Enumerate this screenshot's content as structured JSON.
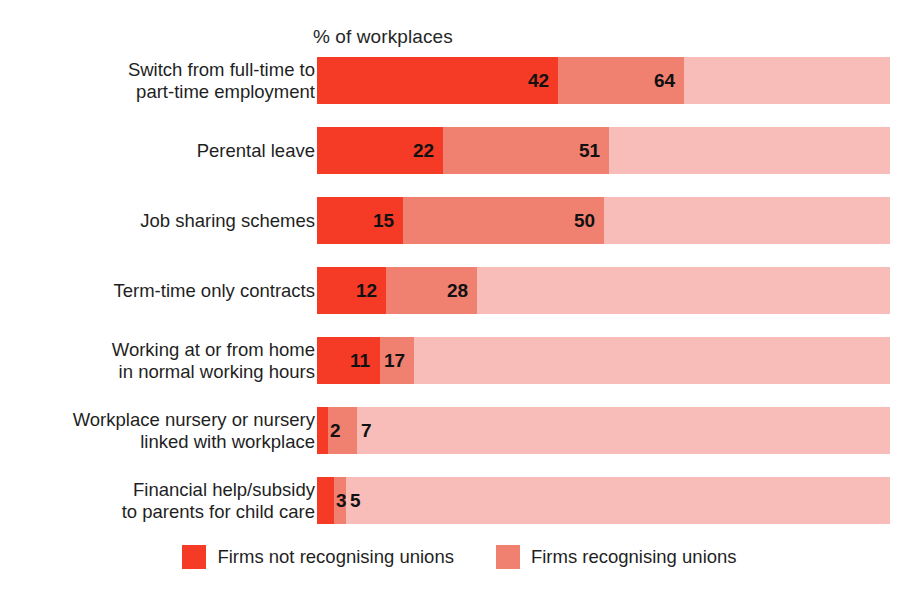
{
  "chart_data": {
    "type": "bar",
    "orientation": "horizontal",
    "stacked": false,
    "overlapping_bars": true,
    "title": "",
    "xlabel": "% of workplaces",
    "ylabel": "",
    "xlim": [
      0,
      100
    ],
    "grid": false,
    "legend_position": "bottom-center",
    "categories": [
      "Switch from full-time to\npart-time employment",
      "Perental leave",
      "Job sharing schemes",
      "Term-time only contracts",
      "Working at or from home\nin normal working hours",
      "Workplace nursery or nursery\nlinked with workplace",
      "Financial help/subsidy\nto parents for child care"
    ],
    "series": [
      {
        "name": "Firms not recognising unions",
        "color": "#f53b26",
        "values": [
          42,
          22,
          15,
          12,
          11,
          2,
          3
        ]
      },
      {
        "name": "Firms recognising unions",
        "color": "#f08070",
        "values": [
          64,
          51,
          50,
          28,
          17,
          7,
          5
        ]
      }
    ],
    "track_color": "#f8bdb8"
  },
  "axis": {
    "title": "% of workplaces"
  },
  "legend": {
    "items": [
      {
        "label": "Firms not recognising unions",
        "color": "#f53b26"
      },
      {
        "label": "Firms recognising unions",
        "color": "#f08070"
      }
    ]
  },
  "rows": [
    {
      "label": "Switch from full-time to\npart-time employment",
      "inner": 42,
      "outer": 64,
      "inner_text": "42",
      "outer_text": "64"
    },
    {
      "label": "Perental leave",
      "inner": 22,
      "outer": 51,
      "inner_text": "22",
      "outer_text": "51"
    },
    {
      "label": "Job sharing schemes",
      "inner": 15,
      "outer": 50,
      "inner_text": "15",
      "outer_text": "50"
    },
    {
      "label": "Term-time only contracts",
      "inner": 12,
      "outer": 28,
      "inner_text": "12",
      "outer_text": "28"
    },
    {
      "label": "Working at or from home\nin normal working hours",
      "inner": 11,
      "outer": 17,
      "inner_text": "11",
      "outer_text": "17"
    },
    {
      "label": "Workplace nursery or nursery\nlinked with workplace",
      "inner": 2,
      "outer": 7,
      "inner_text": "2",
      "outer_text": "7"
    },
    {
      "label": "Financial help/subsidy\nto parents for child care",
      "inner": 3,
      "outer": 5,
      "inner_text": "3",
      "outer_text": "5"
    }
  ],
  "colors": {
    "inner": "#f53b26",
    "outer": "#f08070",
    "track": "#f8bdb8",
    "text": "#1f1f1f",
    "background": "#ffffff"
  }
}
